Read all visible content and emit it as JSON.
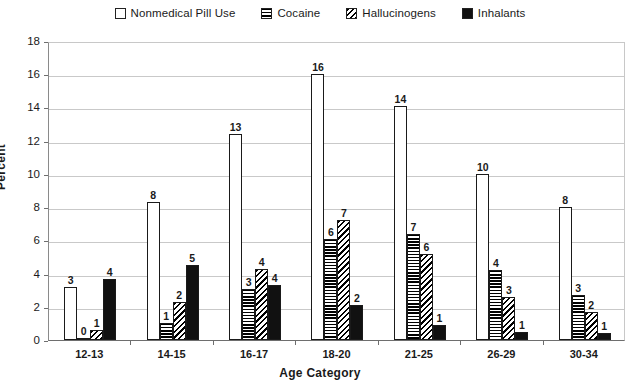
{
  "chart_data": {
    "type": "bar",
    "title": "",
    "xlabel": "Age Category",
    "ylabel": "Percent",
    "categories": [
      "12-13",
      "14-15",
      "16-17",
      "18-20",
      "21-25",
      "26-29",
      "30-34"
    ],
    "ylim": [
      0,
      18
    ],
    "yticks": [
      0,
      2,
      4,
      6,
      8,
      10,
      12,
      14,
      16,
      18
    ],
    "grid": true,
    "legend_position": "top-center",
    "series": [
      {
        "name": "Nonmedical Pill Use",
        "pattern": "solid-white",
        "labels": [
          "3",
          "8",
          "13",
          "16",
          "14",
          "10",
          "8"
        ],
        "values": [
          3.2,
          8.3,
          12.4,
          16.0,
          14.1,
          10.0,
          8.0
        ]
      },
      {
        "name": "Cocaine",
        "pattern": "horizontal-stripes",
        "labels": [
          "0",
          "1",
          "3",
          "6",
          "7",
          "4",
          "3"
        ],
        "values": [
          0.15,
          1.0,
          3.1,
          6.1,
          6.4,
          4.2,
          2.7
        ]
      },
      {
        "name": "Hallucinogens",
        "pattern": "diagonal-stripes",
        "labels": [
          "1",
          "2",
          "4",
          "7",
          "6",
          "3",
          "2"
        ],
        "values": [
          0.6,
          2.3,
          4.3,
          7.2,
          5.2,
          2.6,
          1.7
        ]
      },
      {
        "name": "Inhalants",
        "pattern": "solid-black",
        "labels": [
          "4",
          "5",
          "4",
          "2",
          "1",
          "1",
          "1"
        ],
        "values": [
          3.7,
          4.5,
          3.3,
          2.1,
          0.9,
          0.5,
          0.4
        ]
      }
    ]
  }
}
